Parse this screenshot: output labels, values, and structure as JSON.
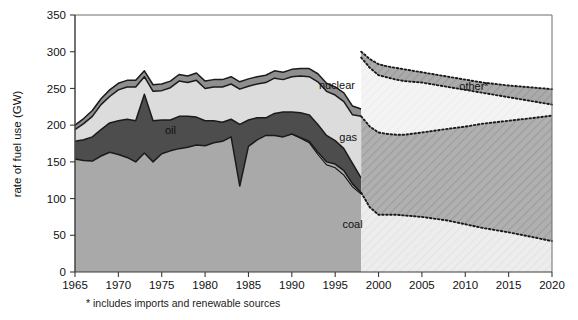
{
  "figure": {
    "background": "#ffffff",
    "footnote": "* includes imports and renewable sources"
  },
  "chart_data": {
    "type": "area",
    "stacked": true,
    "title": "",
    "xlabel": "",
    "ylabel": "rate of fuel use (GW)",
    "xlim": [
      1965,
      2020
    ],
    "ylim": [
      0,
      350
    ],
    "xticks": [
      1965,
      1970,
      1975,
      1980,
      1985,
      1990,
      1995,
      2000,
      2005,
      2010,
      2015,
      2020
    ],
    "yticks": [
      0,
      50,
      100,
      150,
      200,
      250,
      300,
      350
    ],
    "grid": false,
    "legend_position": "inline-annotations",
    "annotations": [
      {
        "text": "oil",
        "x": 1976.0,
        "y": 188,
        "name": "series-label-oil"
      },
      {
        "text": "nuclear",
        "x": 1995.2,
        "y": 249,
        "name": "series-label-nuclear"
      },
      {
        "text": "gas",
        "x": 1996.5,
        "y": 178,
        "name": "series-label-gas"
      },
      {
        "text": "coal",
        "x": 1997.0,
        "y": 60,
        "name": "series-label-coal"
      },
      {
        "text": "other*",
        "x": 2011.0,
        "y": 248,
        "name": "series-label-other"
      }
    ],
    "projection_start": 1998,
    "projection_note": "dotted boundaries and hatched fills mark projected values",
    "x": [
      1965,
      1966,
      1967,
      1968,
      1969,
      1970,
      1971,
      1972,
      1973,
      1974,
      1975,
      1976,
      1977,
      1978,
      1979,
      1980,
      1981,
      1982,
      1983,
      1984,
      1985,
      1986,
      1987,
      1988,
      1989,
      1990,
      1991,
      1992,
      1993,
      1994,
      1995,
      1996,
      1997,
      1998
    ],
    "series": [
      {
        "name": "coal",
        "color": "#a9a9a9",
        "values": [
          154,
          152,
          151,
          158,
          163,
          160,
          156,
          150,
          162,
          150,
          161,
          165,
          168,
          170,
          173,
          172,
          176,
          178,
          184,
          117,
          171,
          180,
          186,
          186,
          184,
          188,
          183,
          178,
          163,
          150,
          147,
          138,
          120,
          108
        ]
      },
      {
        "name": "oil",
        "color": "#4d4d4d",
        "values": [
          24,
          28,
          33,
          36,
          40,
          46,
          52,
          56,
          80,
          56,
          46,
          42,
          44,
          42,
          38,
          34,
          30,
          26,
          24,
          84,
          36,
          30,
          24,
          30,
          34,
          30,
          34,
          36,
          38,
          36,
          32,
          30,
          28,
          20
        ]
      },
      {
        "name": "gas",
        "color": "#4d4d4d",
        "values": [
          0,
          0,
          0,
          0,
          0,
          0,
          0,
          0,
          0,
          0,
          0,
          0,
          0,
          0,
          0,
          0,
          0,
          0,
          0,
          0,
          0,
          0,
          0,
          0,
          0,
          0,
          0,
          0,
          0,
          0,
          0,
          0,
          0,
          0
        ]
      },
      {
        "name": "nuclear",
        "color": "#dcdcdc",
        "values": [
          16,
          22,
          28,
          34,
          36,
          42,
          44,
          46,
          24,
          40,
          40,
          44,
          48,
          46,
          50,
          44,
          46,
          48,
          48,
          48,
          46,
          46,
          48,
          48,
          44,
          48,
          50,
          52,
          58,
          60,
          62,
          64,
          66,
          84
        ]
      },
      {
        "name": "other",
        "color": "#8e8e8e",
        "values": [
          6,
          7,
          8,
          8,
          9,
          9,
          9,
          9,
          8,
          9,
          9,
          9,
          9,
          9,
          10,
          10,
          10,
          10,
          10,
          10,
          10,
          10,
          10,
          10,
          10,
          10,
          10,
          11,
          11,
          11,
          11,
          12,
          12,
          10
        ]
      }
    ],
    "projection": {
      "x": [
        1998,
        1999,
        2000,
        2001,
        2002,
        2003,
        2005,
        2008,
        2010,
        2012,
        2015,
        2018,
        2020
      ],
      "coal": [
        108,
        88,
        78,
        78,
        78,
        77,
        75,
        70,
        65,
        60,
        54,
        47,
        42
      ],
      "gas_top": [
        212,
        198,
        190,
        188,
        187,
        187,
        190,
        195,
        198,
        202,
        206,
        210,
        213
      ],
      "nuclear_top": [
        292,
        278,
        268,
        265,
        262,
        260,
        258,
        252,
        248,
        244,
        238,
        232,
        228
      ],
      "other_top": [
        300,
        290,
        283,
        280,
        278,
        276,
        272,
        266,
        262,
        258,
        254,
        251,
        249
      ]
    },
    "observed_totals": [
      200,
      209,
      220,
      236,
      248,
      257,
      261,
      261,
      274,
      255,
      256,
      260,
      269,
      267,
      271,
      260,
      262,
      262,
      266,
      259,
      263,
      266,
      268,
      274,
      272,
      276,
      277,
      277,
      270,
      257,
      252,
      244,
      226,
      222
    ]
  },
  "axes": {
    "y_title": "rate of fuel use (GW)",
    "y_tick_labels": [
      "0",
      "50",
      "100",
      "150",
      "200",
      "250",
      "300",
      "350"
    ],
    "x_tick_labels": [
      "1965",
      "1970",
      "1975",
      "1980",
      "1985",
      "1990",
      "1995",
      "2000",
      "2005",
      "2010",
      "2015",
      "2020"
    ]
  },
  "colors": {
    "coal": "#a9a9a9",
    "oil": "#4d4d4d",
    "gas": "#4d4d4d",
    "nuclear": "#dcdcdc",
    "other": "#8e8e8e",
    "proj_coal": "#ececec",
    "proj_gas": "#adadad",
    "proj_nuclear": "#f2f2f2",
    "proj_other": "#a8a8a8",
    "outline": "#1a1a1a",
    "frame": "#6d6d6d",
    "axis": "#3a3a3a",
    "background": "#ffffff"
  }
}
